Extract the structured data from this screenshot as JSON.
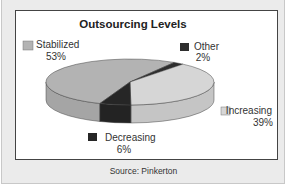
{
  "chart_data": {
    "type": "pie",
    "title": "Outsourcing Levels",
    "categories": [
      "Stabilized",
      "Other",
      "Increasing",
      "Decreasing"
    ],
    "values": [
      53,
      2,
      39,
      6
    ],
    "labels": [
      "53%",
      "2%",
      "39%",
      "6%"
    ],
    "colors": {
      "Stabilized": "#b3b3b3",
      "Other": "#2e2e2e",
      "Increasing": "#d6d6d6",
      "Decreasing": "#262626"
    },
    "three_d": true
  },
  "source": "Source: Pinkerton"
}
